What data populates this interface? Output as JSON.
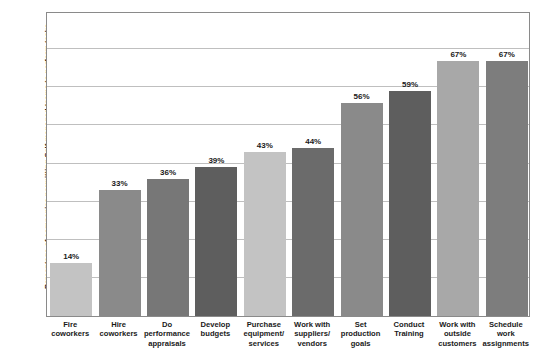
{
  "chart_data": {
    "type": "bar",
    "title": "",
    "subtitle": "",
    "xlabel": "",
    "ylabel": "Percentage of companies permitting Self-managed teams to perform tasks",
    "ylim": [
      0,
      80
    ],
    "grid": true,
    "gridline_values": [
      10,
      20,
      30,
      40,
      50,
      60,
      70
    ],
    "legend": "none",
    "categories": [
      "Fire coworkers",
      "Hire coworkers",
      "Do performance appraisals",
      "Develop budgets",
      "Purchase equipment/ services",
      "Work with suppliers/ vendors",
      "Set production goals",
      "Conduct Training",
      "Work with outside customers",
      "Schedule work assignments"
    ],
    "category_lines": [
      [
        "Fire",
        "coworkers"
      ],
      [
        "Hire",
        "coworkers"
      ],
      [
        "Do",
        "performance",
        "appraisals"
      ],
      [
        "Develop",
        "budgets"
      ],
      [
        "Purchase",
        "equipment/",
        "services"
      ],
      [
        "Work with",
        "suppliers/",
        "vendors"
      ],
      [
        "Set",
        "production",
        "goals"
      ],
      [
        "Conduct",
        "Training"
      ],
      [
        "Work with",
        "outside",
        "customers"
      ],
      [
        "Schedule",
        "work",
        "assignments"
      ]
    ],
    "values": [
      14,
      33,
      36,
      39,
      43,
      44,
      56,
      59,
      67,
      67
    ],
    "value_labels": [
      "14%",
      "33%",
      "36%",
      "39%",
      "43%",
      "44%",
      "56%",
      "59%",
      "67%",
      "67%"
    ],
    "bar_colors": [
      "#c3c3c3",
      "#8a8a8a",
      "#777777",
      "#5e5e5e",
      "#c3c3c3",
      "#6b6b6b",
      "#8a8a8a",
      "#5e5e5e",
      "#a8a8a8",
      "#7d7d7d"
    ],
    "frame_color": "#8a8a8a",
    "gridline_color": "#bfbfbf",
    "text_color": "#1a1a1a",
    "background": "#ffffff"
  }
}
